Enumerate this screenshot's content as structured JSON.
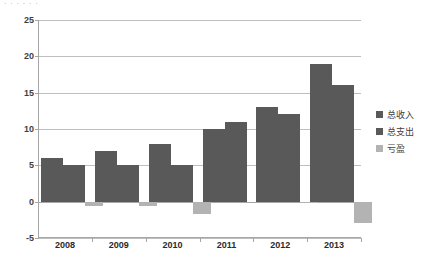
{
  "top_remnant": "· · · · · ·",
  "chart_data": {
    "type": "bar",
    "title": "",
    "xlabel": "",
    "ylabel": "",
    "categories": [
      "2008",
      "2009",
      "2010",
      "2011",
      "2012",
      "2013"
    ],
    "series": [
      {
        "name": "总收入",
        "color": "#595959",
        "values": [
          6,
          7,
          8,
          10,
          13,
          19
        ]
      },
      {
        "name": "总支出",
        "color": "#595959",
        "values": [
          5,
          5,
          5,
          11,
          12,
          16
        ]
      },
      {
        "name": "亏盈",
        "color": "#b3b3b3",
        "values": [
          -0.6,
          -0.6,
          -1.7,
          0,
          -0.2,
          -3
        ]
      }
    ],
    "ylim": [
      -5,
      25
    ],
    "ytick_labels": [
      "25",
      "20",
      "15",
      "10",
      "5",
      "0",
      "-5"
    ],
    "ytick_values": [
      25,
      20,
      15,
      10,
      5,
      0,
      -5
    ],
    "grid": true,
    "legend_position": "right"
  },
  "legend": {
    "items": [
      {
        "label": "总收入",
        "color": "#595959"
      },
      {
        "label": "总支出",
        "color": "#595959"
      },
      {
        "label": "亏盈",
        "color": "#b3b3b3"
      }
    ]
  }
}
